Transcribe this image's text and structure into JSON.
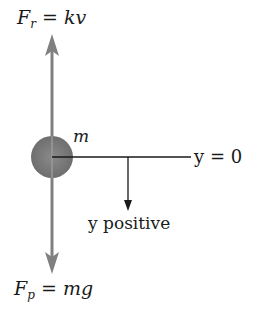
{
  "diagram": {
    "type": "free-body-diagram",
    "mass_label": "m",
    "upward_force": {
      "symbol": "F",
      "subscript": "r",
      "equals": "=",
      "expr": "kv"
    },
    "downward_force": {
      "symbol": "F",
      "subscript": "p",
      "equals": "=",
      "expr": "mg"
    },
    "reference_line_label": "y = 0",
    "direction_label": "y positive",
    "colors": {
      "ball": "#7a7a7a",
      "force_arrow": "#808080",
      "line": "#1a1a1a"
    }
  }
}
